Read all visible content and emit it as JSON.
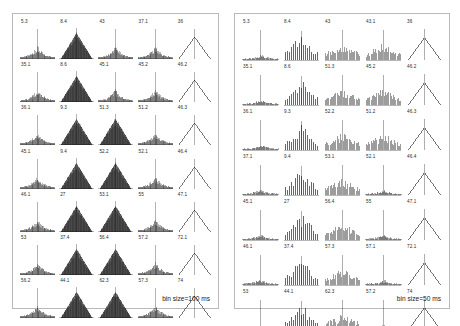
{
  "figure": {
    "background_color": "#ffffff",
    "panel_border_color": "#b9b9b9",
    "trace_color": "#1a1a1a"
  },
  "panels": [
    {
      "id": "panel-left",
      "caption": "bin size=100 ms",
      "bin_size_ms": 100,
      "rows": 7,
      "cols": 5
    },
    {
      "id": "panel-right",
      "caption": "bin size=50 ms",
      "bin_size_ms": 50,
      "rows": 7,
      "cols": 5
    }
  ],
  "chart_data": [
    {
      "type": "line",
      "title": "Cross-correlogram grid, bin size=100 ms",
      "xlabel": "",
      "ylabel": "",
      "grid": false,
      "legend": "none",
      "panel": "panel-left",
      "rows": 7,
      "cols": 5,
      "cells": [
        {
          "label": "5.3",
          "shape": "broad-peak",
          "row": 1,
          "col": 1
        },
        {
          "label": "8.4",
          "shape": "triangle-filled",
          "row": 1,
          "col": 2
        },
        {
          "label": "43",
          "shape": "broad-peak",
          "row": 1,
          "col": 3
        },
        {
          "label": "37.1",
          "shape": "broad-peak",
          "row": 1,
          "col": 4
        },
        {
          "label": "36",
          "shape": "sparse-vee",
          "row": 1,
          "col": 5
        },
        {
          "label": "35.1",
          "shape": "broad-peak",
          "row": 2,
          "col": 1
        },
        {
          "label": "8.6",
          "shape": "triangle-filled",
          "row": 2,
          "col": 2
        },
        {
          "label": "45.1",
          "shape": "broad-peak",
          "row": 2,
          "col": 3
        },
        {
          "label": "45.2",
          "shape": "broad-peak",
          "row": 2,
          "col": 4
        },
        {
          "label": "46.2",
          "shape": "sparse-vee",
          "row": 2,
          "col": 5
        },
        {
          "label": "36.1",
          "shape": "broad-peak",
          "row": 3,
          "col": 1
        },
        {
          "label": "9.3",
          "shape": "triangle-filled",
          "row": 3,
          "col": 2
        },
        {
          "label": "51.3",
          "shape": "triangle-filled",
          "row": 3,
          "col": 3
        },
        {
          "label": "51.2",
          "shape": "broad-peak",
          "row": 3,
          "col": 4
        },
        {
          "label": "46.3",
          "shape": "sparse-vee",
          "row": 3,
          "col": 5
        },
        {
          "label": "45.1",
          "shape": "broad-peak",
          "row": 4,
          "col": 1
        },
        {
          "label": "9.4",
          "shape": "triangle-filled",
          "row": 4,
          "col": 2
        },
        {
          "label": "52.2",
          "shape": "triangle-filled",
          "row": 4,
          "col": 3
        },
        {
          "label": "52.1",
          "shape": "broad-peak",
          "row": 4,
          "col": 4
        },
        {
          "label": "46.4",
          "shape": "sparse-vee",
          "row": 4,
          "col": 5
        },
        {
          "label": "46.1",
          "shape": "broad-peak",
          "row": 5,
          "col": 1
        },
        {
          "label": "27",
          "shape": "triangle-filled",
          "row": 5,
          "col": 2
        },
        {
          "label": "53.1",
          "shape": "triangle-filled",
          "row": 5,
          "col": 3
        },
        {
          "label": "55",
          "shape": "broad-peak",
          "row": 5,
          "col": 4
        },
        {
          "label": "47.1",
          "shape": "sparse-vee",
          "row": 5,
          "col": 5
        },
        {
          "label": "53",
          "shape": "broad-peak",
          "row": 6,
          "col": 1
        },
        {
          "label": "37.4",
          "shape": "triangle-filled",
          "row": 6,
          "col": 2
        },
        {
          "label": "56.4",
          "shape": "triangle-filled",
          "row": 6,
          "col": 3
        },
        {
          "label": "57.2",
          "shape": "broad-peak",
          "row": 6,
          "col": 4
        },
        {
          "label": "72.1",
          "shape": "sparse-vee",
          "row": 6,
          "col": 5
        },
        {
          "label": "56.2",
          "shape": "broad-peak",
          "row": 7,
          "col": 1
        },
        {
          "label": "44.1",
          "shape": "triangle-filled",
          "row": 7,
          "col": 2
        },
        {
          "label": "62.3",
          "shape": "triangle-filled",
          "row": 7,
          "col": 3
        },
        {
          "label": "57.3",
          "shape": "broad-peak",
          "row": 7,
          "col": 4
        },
        {
          "label": "74",
          "shape": "sparse-vee",
          "row": 7,
          "col": 5
        }
      ]
    },
    {
      "type": "line",
      "title": "Cross-correlogram grid, bin size=50 ms",
      "xlabel": "",
      "ylabel": "",
      "grid": false,
      "legend": "none",
      "panel": "panel-right",
      "rows": 7,
      "cols": 5,
      "cells": [
        {
          "label": "5.3",
          "shape": "flat-bump",
          "row": 1,
          "col": 1
        },
        {
          "label": "8.4",
          "shape": "comb-tall",
          "row": 1,
          "col": 2
        },
        {
          "label": "43",
          "shape": "comb-short",
          "row": 1,
          "col": 3
        },
        {
          "label": "43.1",
          "shape": "comb-short",
          "row": 1,
          "col": 4
        },
        {
          "label": "36",
          "shape": "sparse-vee",
          "row": 1,
          "col": 5
        },
        {
          "label": "35.1",
          "shape": "flat-bump",
          "row": 2,
          "col": 1
        },
        {
          "label": "8.6",
          "shape": "comb-tall",
          "row": 2,
          "col": 2
        },
        {
          "label": "51.3",
          "shape": "comb-short",
          "row": 2,
          "col": 3
        },
        {
          "label": "45.2",
          "shape": "comb-short",
          "row": 2,
          "col": 4
        },
        {
          "label": "46.2",
          "shape": "sparse-vee",
          "row": 2,
          "col": 5
        },
        {
          "label": "36.1",
          "shape": "flat-bump",
          "row": 3,
          "col": 1
        },
        {
          "label": "9.3",
          "shape": "comb-tall",
          "row": 3,
          "col": 2
        },
        {
          "label": "52.2",
          "shape": "comb-short",
          "row": 3,
          "col": 3
        },
        {
          "label": "51.2",
          "shape": "comb-short",
          "row": 3,
          "col": 4
        },
        {
          "label": "46.3",
          "shape": "sparse-vee",
          "row": 3,
          "col": 5
        },
        {
          "label": "37.1",
          "shape": "flat-bump",
          "row": 4,
          "col": 1
        },
        {
          "label": "9.4",
          "shape": "comb-tall",
          "row": 4,
          "col": 2
        },
        {
          "label": "53.1",
          "shape": "comb-short",
          "row": 4,
          "col": 3
        },
        {
          "label": "52.1",
          "shape": "flat-bump",
          "row": 4,
          "col": 4
        },
        {
          "label": "46.4",
          "shape": "sparse-vee",
          "row": 4,
          "col": 5
        },
        {
          "label": "45.1",
          "shape": "flat-bump",
          "row": 5,
          "col": 1
        },
        {
          "label": "27",
          "shape": "comb-tall",
          "row": 5,
          "col": 2
        },
        {
          "label": "56.4",
          "shape": "comb-short",
          "row": 5,
          "col": 3
        },
        {
          "label": "55",
          "shape": "flat-bump",
          "row": 5,
          "col": 4
        },
        {
          "label": "47.1",
          "shape": "sparse-vee",
          "row": 5,
          "col": 5
        },
        {
          "label": "46.1",
          "shape": "flat-bump",
          "row": 6,
          "col": 1
        },
        {
          "label": "37.4",
          "shape": "comb-tall",
          "row": 6,
          "col": 2
        },
        {
          "label": "57.3",
          "shape": "comb-short",
          "row": 6,
          "col": 3
        },
        {
          "label": "57.1",
          "shape": "flat-bump",
          "row": 6,
          "col": 4
        },
        {
          "label": "72.1",
          "shape": "sparse-vee",
          "row": 6,
          "col": 5
        },
        {
          "label": "53",
          "shape": "flat-bump",
          "row": 7,
          "col": 1
        },
        {
          "label": "44.1",
          "shape": "comb-tall",
          "row": 7,
          "col": 2
        },
        {
          "label": "62.3",
          "shape": "comb-short",
          "row": 7,
          "col": 3
        },
        {
          "label": "57.2",
          "shape": "flat-bump",
          "row": 7,
          "col": 4
        },
        {
          "label": "74",
          "shape": "sparse-vee",
          "row": 7,
          "col": 5
        }
      ]
    }
  ]
}
